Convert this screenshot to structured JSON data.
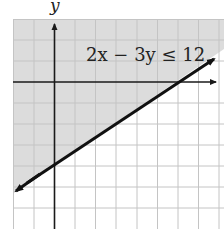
{
  "graph": {
    "inequality": "2x − 3y ≤ 12",
    "y_axis_label": "y",
    "boundary_line": "2x - 3y = 12",
    "x_intercept": 6,
    "y_intercept": -4,
    "shaded_region": "above the line (includes origin)",
    "line_style": "solid",
    "colors": {
      "shade": "#dcdcdc",
      "grid": "#c4c4c4",
      "axes": "#1a1a1a",
      "line": "#111111"
    },
    "grid": {
      "x_range": [
        -2,
        8
      ],
      "y_range": [
        -7,
        3
      ],
      "step": 1
    }
  }
}
